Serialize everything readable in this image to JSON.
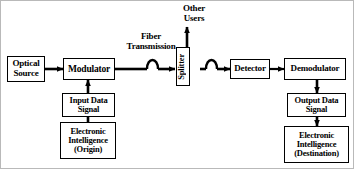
{
  "diagram": {
    "stroke_color": "#000000",
    "background_color": "#ffffff",
    "frame_color": "#b9b9b9"
  },
  "blocks": {
    "optical_source": {
      "line1": "Optical",
      "line2": "Source"
    },
    "modulator": {
      "label": "Modulator"
    },
    "splitter": {
      "label": "Splitter"
    },
    "detector": {
      "label": "Detector"
    },
    "demodulator": {
      "label": "Demodulator"
    },
    "input_data_signal": {
      "line1": "Input Data",
      "line2": "Signal"
    },
    "electronic_intelligence_origin": {
      "line1": "Electronic",
      "line2": "Intelligence",
      "line3": "(Origin)"
    },
    "output_data_signal": {
      "line1": "Output Data",
      "line2": "Signal"
    },
    "electronic_intelligence_destination": {
      "line1": "Electronic",
      "line2": "Intelligence",
      "line3": "(Destination)"
    }
  },
  "labels": {
    "fiber_transmission": {
      "line1": "Fiber",
      "line2": "Transmission"
    },
    "other_users": {
      "line1": "Other",
      "line2": "Users"
    }
  },
  "symbols": {
    "fiber_coil_1": "fiber-coil-icon",
    "fiber_coil_2": "fiber-coil-icon"
  }
}
